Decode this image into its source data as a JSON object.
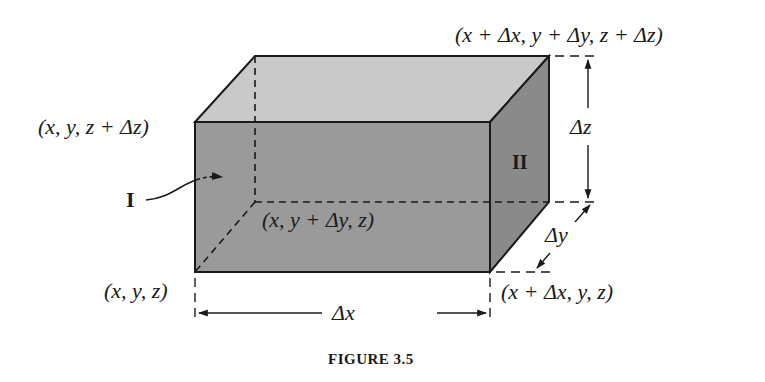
{
  "figure": {
    "caption": "FIGURE 3.5",
    "type": "rectangular box (volume element) in 3D with labeled corners and dimensions"
  },
  "colors": {
    "front_face": "#9a9a9a",
    "top_face": "#c9c9c9",
    "side_face": "#8a8a8a",
    "stroke": "#1a1a1a",
    "background": "#ffffff"
  },
  "corners": {
    "origin": "(x, y, z)",
    "top_front_left": "(x, y, z + Δz)",
    "top_back_right": "(x + Δx, y + Δy, z + Δz)",
    "hidden_back_left": "(x, y + Δy, z)",
    "bottom_front_right": "(x + Δx, y, z)"
  },
  "dimensions": {
    "dx": "Δx",
    "dy": "Δy",
    "dz": "Δz"
  },
  "faces": {
    "face_I": "I",
    "face_II": "II"
  }
}
